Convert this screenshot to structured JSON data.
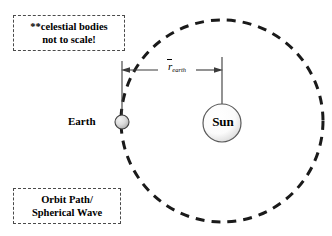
{
  "figure": {
    "background_color": "#ffffff",
    "width": 332,
    "height": 236
  },
  "notes": {
    "scale_note": {
      "line1": "**celestial bodies",
      "line2": "not to scale!",
      "border_style": "dashed",
      "border_color": "#4a4a4a"
    },
    "orbit_note": {
      "line1": "Orbit Path/",
      "line2": "Spherical Wave",
      "border_style": "dashed",
      "border_color": "#4a4a4a"
    }
  },
  "bodies": {
    "earth": {
      "label": "Earth",
      "fill_color": "#d6d6d6",
      "stroke_color": "#3a3a3a",
      "center_x": 122,
      "center_y": 122,
      "radius": 7
    },
    "sun": {
      "label": "Sun",
      "fill_color": "#fdfdfd",
      "stroke_color": "#555555",
      "center_x": 222,
      "center_y": 123,
      "radius": 19
    }
  },
  "dimension": {
    "label_variable": "r",
    "label_subscript": "earth",
    "overbar": true,
    "from_x": 122,
    "to_x": 222,
    "line_y": 70,
    "stroke_color": "#3a3a3a"
  },
  "orbit": {
    "label": "orbit-path",
    "center_x": 222,
    "center_y": 121,
    "radius": 101,
    "stroke_color": "#1a1a1a",
    "stroke_width": 3,
    "dash_pattern": "9 7"
  }
}
